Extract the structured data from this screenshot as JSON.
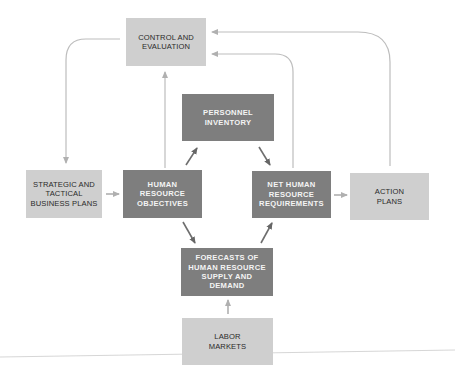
{
  "diagram": {
    "type": "flowchart",
    "colors": {
      "light_box": "#cfcfcf",
      "dark_box": "#7e7e7e",
      "light_edge": "#b8b8b8",
      "dark_edge": "#6e6e6e"
    },
    "nodes": [
      {
        "id": "control",
        "label": "CONTROL AND\nEVALUATION",
        "style": "light"
      },
      {
        "id": "personnel",
        "label": "PERSONNEL\nINVENTORY",
        "style": "dark"
      },
      {
        "id": "strategic",
        "label": "STRATEGIC AND\nTACTICAL\nBUSINESS PLANS",
        "style": "light"
      },
      {
        "id": "hr_objectives",
        "label": "HUMAN\nRESOURCE\nOBJECTIVES",
        "style": "dark"
      },
      {
        "id": "net_hr",
        "label": "NET HUMAN\nRESOURCE\nREQUIREMENTS",
        "style": "dark"
      },
      {
        "id": "action",
        "label": "ACTION\nPLANS",
        "style": "light"
      },
      {
        "id": "forecasts",
        "label": "FORECASTS OF\nHUMAN RESOURCE\nSUPPLY AND\nDEMAND",
        "style": "dark"
      },
      {
        "id": "labor",
        "label": "LABOR\nMARKETS",
        "style": "light"
      }
    ],
    "edges": [
      {
        "from": "control",
        "to": "strategic"
      },
      {
        "from": "strategic",
        "to": "hr_objectives"
      },
      {
        "from": "hr_objectives",
        "to": "control"
      },
      {
        "from": "hr_objectives",
        "to": "personnel"
      },
      {
        "from": "personnel",
        "to": "net_hr"
      },
      {
        "from": "hr_objectives",
        "to": "forecasts"
      },
      {
        "from": "forecasts",
        "to": "net_hr"
      },
      {
        "from": "labor",
        "to": "forecasts"
      },
      {
        "from": "net_hr",
        "to": "action"
      },
      {
        "from": "net_hr",
        "to": "control"
      },
      {
        "from": "action",
        "to": "control"
      }
    ]
  }
}
